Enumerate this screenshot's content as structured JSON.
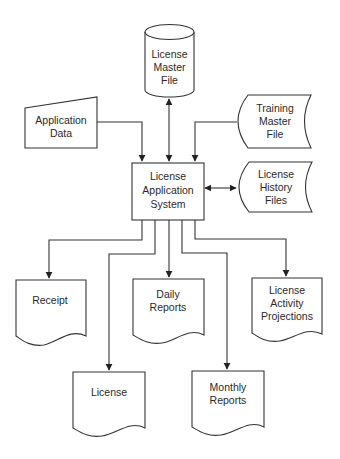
{
  "diagram": {
    "type": "system flowchart",
    "colors": {
      "stroke": "#333333",
      "text": "#2a2a2a",
      "background": "#ffffff"
    },
    "nodes": {
      "master_file": {
        "shape": "cylinder",
        "lines": [
          "License",
          "Master",
          "File"
        ]
      },
      "application_data": {
        "shape": "manual-input",
        "lines": [
          "Application",
          "Data"
        ]
      },
      "training_file": {
        "shape": "stored-data",
        "lines": [
          "Training",
          "Master",
          "File"
        ]
      },
      "system": {
        "shape": "process",
        "lines": [
          "License",
          "Application",
          "System"
        ]
      },
      "history_files": {
        "shape": "stored-data",
        "lines": [
          "License",
          "History",
          "Files"
        ]
      },
      "receipt": {
        "shape": "document",
        "lines": [
          "Receipt"
        ]
      },
      "daily_reports": {
        "shape": "document",
        "lines": [
          "Daily",
          "Reports"
        ]
      },
      "activity_projections": {
        "shape": "document",
        "lines": [
          "License",
          "Activity",
          "Projections"
        ]
      },
      "license": {
        "shape": "document",
        "lines": [
          "License"
        ]
      },
      "monthly_reports": {
        "shape": "document",
        "lines": [
          "Monthly",
          "Reports"
        ]
      }
    },
    "edges": [
      {
        "from": "master_file",
        "to": "system",
        "bidirectional": true
      },
      {
        "from": "application_data",
        "to": "system",
        "bidirectional": false
      },
      {
        "from": "training_file",
        "to": "system",
        "bidirectional": false
      },
      {
        "from": "history_files",
        "to": "system",
        "bidirectional": true
      },
      {
        "from": "system",
        "to": "receipt",
        "bidirectional": false
      },
      {
        "from": "system",
        "to": "license",
        "bidirectional": false
      },
      {
        "from": "system",
        "to": "daily_reports",
        "bidirectional": false
      },
      {
        "from": "system",
        "to": "monthly_reports",
        "bidirectional": false
      },
      {
        "from": "system",
        "to": "activity_projections",
        "bidirectional": false
      }
    ]
  }
}
